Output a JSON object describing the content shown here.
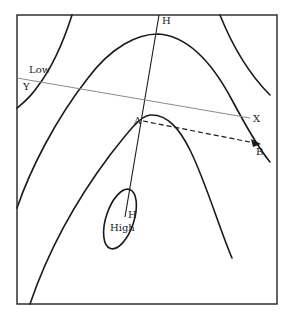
{
  "diagram": {
    "labels": {
      "low": "Low",
      "high": "High",
      "ridge_top": "H",
      "ridge_center": "H",
      "section_start": "Y",
      "section_end": "X",
      "point_a": "A",
      "point_b": "B"
    },
    "colors": {
      "ink": "#1a1a1a",
      "section_line": "#8a8a8a"
    }
  }
}
